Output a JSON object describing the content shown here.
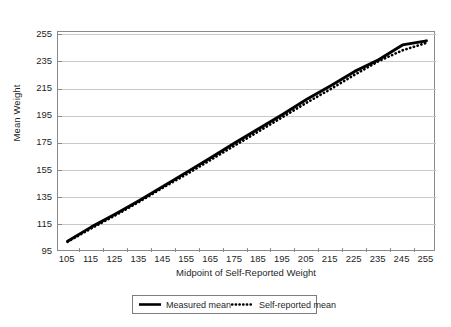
{
  "chart_data": {
    "type": "line",
    "title": "",
    "xlabel": "Midpoint of Self-Reported Weight",
    "ylabel": "Mean Weight",
    "categories": [
      105,
      115,
      125,
      135,
      145,
      155,
      165,
      175,
      185,
      195,
      205,
      215,
      225,
      235,
      245,
      255
    ],
    "xticklabels": [
      "105",
      "115",
      "125",
      "135",
      "145",
      "155",
      "165",
      "175",
      "185",
      "195",
      "205",
      "215",
      "225",
      "235",
      "245",
      "255"
    ],
    "yticks": [
      95,
      115,
      135,
      155,
      175,
      195,
      215,
      235,
      255
    ],
    "yticklabels": [
      "95",
      "115",
      "135",
      "155",
      "175",
      "195",
      "215",
      "235",
      "255"
    ],
    "ylim": [
      95,
      257
    ],
    "xlim": [
      101,
      259
    ],
    "grid": "horizontal",
    "legend_position": "below",
    "series": [
      {
        "name": "Measured mean",
        "style": "solid",
        "color": "#000000",
        "values": [
          103.0,
          113.5,
          123.0,
          133.0,
          143.5,
          154.0,
          164.5,
          175.5,
          186.0,
          196.5,
          207.5,
          217.5,
          228.0,
          236.5,
          247.5,
          250.5
        ]
      },
      {
        "name": "Self-reported mean",
        "style": "dotted",
        "color": "#000000",
        "values": [
          102.5,
          112.5,
          122.0,
          132.0,
          142.5,
          152.5,
          163.0,
          173.5,
          184.0,
          194.5,
          205.0,
          215.0,
          225.5,
          235.5,
          243.5,
          249.0
        ]
      }
    ]
  },
  "legend": {
    "entries": [
      {
        "label": "Measured mean",
        "style": "solid"
      },
      {
        "label": "Self-reported mean",
        "style": "dotted"
      }
    ]
  },
  "colors": {
    "line": "#000000",
    "grid": "#c9c9c9",
    "frame": "#8a8a8a",
    "text": "#1f1f1f",
    "background": "#ffffff"
  }
}
